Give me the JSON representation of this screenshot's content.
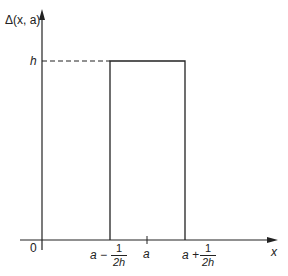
{
  "diagram": {
    "type": "rectangular-pulse",
    "y_axis_label": "Δ(x, a)",
    "x_axis_label": "x",
    "origin_label": "0",
    "height_label": "h",
    "x_ticks": [
      {
        "id": "left",
        "prefix": "a −",
        "num": "1",
        "den": "2h"
      },
      {
        "id": "center",
        "label": "a"
      },
      {
        "id": "right",
        "prefix": "a +",
        "num": "1",
        "den": "2h"
      }
    ],
    "colors": {
      "line": "#222222",
      "background": "#ffffff"
    }
  }
}
